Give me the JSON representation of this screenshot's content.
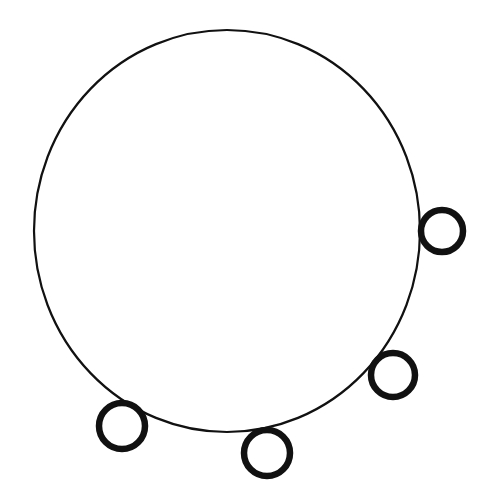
{
  "diagram": {
    "background": "#ffffff",
    "stroke_color": "#111111",
    "main_circle": {
      "cx": 227,
      "cy": 231,
      "rx": 193,
      "ry": 201,
      "stroke_width": 2.2
    },
    "small_circles": [
      {
        "name": "right",
        "cx": 442,
        "cy": 231,
        "r": 21,
        "stroke_width": 6.5
      },
      {
        "name": "lower-right",
        "cx": 393,
        "cy": 375,
        "r": 22,
        "stroke_width": 6.5
      },
      {
        "name": "bottom",
        "cx": 267,
        "cy": 453,
        "r": 23,
        "stroke_width": 6.5
      },
      {
        "name": "bottom-left",
        "cx": 122,
        "cy": 426,
        "r": 23,
        "stroke_width": 6.5
      }
    ]
  }
}
